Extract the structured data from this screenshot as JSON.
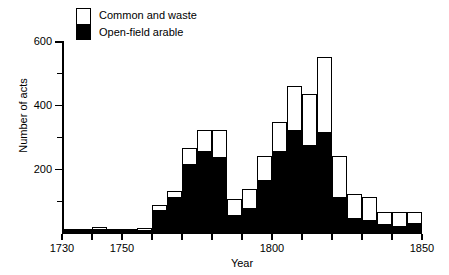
{
  "chart_data": {
    "type": "bar",
    "subtype": "stacked-histogram",
    "title": "",
    "xlabel": "Year",
    "ylabel": "Number of acts",
    "xlim": [
      1730,
      1850
    ],
    "ylim": [
      0,
      620
    ],
    "bin_width": 5,
    "grid": false,
    "legend_position": "top-left-inside",
    "series": [
      {
        "name": "Open-field arable",
        "color": "#000000",
        "values": [
          8,
          6,
          10,
          8,
          6,
          8,
          70,
          110,
          215,
          255,
          235,
          55,
          75,
          165,
          255,
          320,
          275,
          315,
          110,
          45,
          40,
          25,
          20,
          30,
          5
        ]
      },
      {
        "name": "Common and waste",
        "color": "#ffffff",
        "values": [
          4,
          4,
          6,
          4,
          4,
          6,
          15,
          20,
          50,
          65,
          85,
          50,
          60,
          75,
          90,
          140,
          160,
          235,
          130,
          75,
          70,
          40,
          45,
          35,
          5
        ]
      }
    ],
    "totals": [
      12,
      10,
      16,
      12,
      10,
      14,
      85,
      130,
      265,
      320,
      320,
      105,
      135,
      240,
      345,
      460,
      435,
      550,
      240,
      120,
      110,
      65,
      65,
      65,
      10
    ],
    "bin_starts": [
      1730,
      1735,
      1740,
      1745,
      1750,
      1755,
      1760,
      1765,
      1770,
      1775,
      1780,
      1785,
      1790,
      1795,
      1800,
      1805,
      1810,
      1815,
      1820,
      1825,
      1830,
      1835,
      1840,
      1845,
      1850
    ],
    "x_ticks": [
      1730,
      1740,
      1750,
      1760,
      1770,
      1780,
      1790,
      1800,
      1810,
      1820,
      1830,
      1840,
      1850
    ],
    "x_tick_labels_shown": [
      "1730",
      "1750",
      "1800",
      "1850"
    ],
    "y_ticks_major": [
      200,
      400,
      600
    ],
    "y_ticks_minor": [
      100,
      300,
      500
    ],
    "y_tick_labels": [
      "200",
      "400",
      "600"
    ]
  },
  "axes": {
    "ylabel": "Number of acts",
    "xlabel": "Year",
    "y_labels": [
      "600",
      "400",
      "200"
    ],
    "x_labels": [
      "1730",
      "1750",
      "1800",
      "1850"
    ]
  },
  "legend": {
    "items": [
      {
        "label": "Common and waste",
        "color": "#ffffff"
      },
      {
        "label": "Open-field arable",
        "color": "#000000"
      }
    ]
  }
}
